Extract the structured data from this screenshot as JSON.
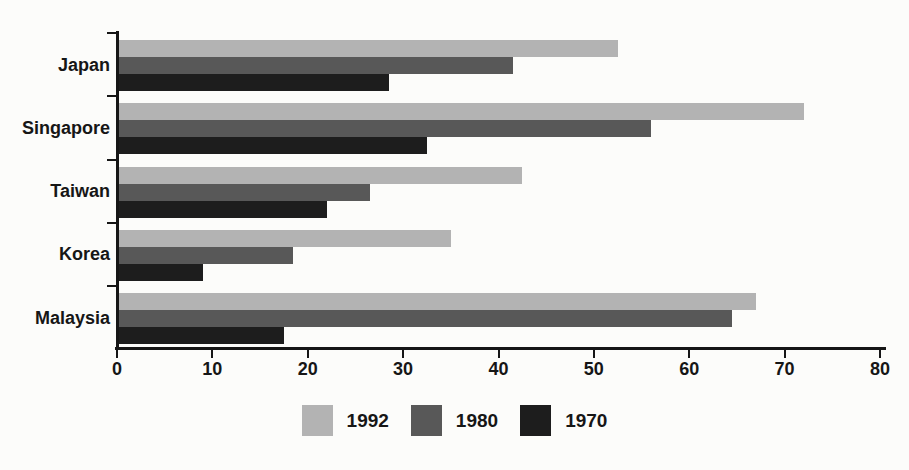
{
  "chart_data": {
    "type": "bar",
    "orientation": "horizontal",
    "title": "",
    "xlabel": "",
    "ylabel": "",
    "categories": [
      "Japan",
      "Singapore",
      "Taiwan",
      "Korea",
      "Malaysia"
    ],
    "series": [
      {
        "name": "1992",
        "color": "#b3b3b3",
        "values": [
          52.5,
          72,
          42.5,
          35,
          67
        ]
      },
      {
        "name": "1980",
        "color": "#585858",
        "values": [
          41.5,
          56,
          26.5,
          18.5,
          64.5
        ]
      },
      {
        "name": "1970",
        "color": "#1d1d1d",
        "values": [
          28.5,
          32.5,
          22,
          9,
          17.5
        ]
      }
    ],
    "xlim": [
      0,
      80
    ],
    "x_ticks": [
      0,
      10,
      20,
      30,
      40,
      50,
      60,
      70,
      80
    ],
    "grid": false,
    "legend_position": "bottom-center",
    "legend": [
      "1992",
      "1980",
      "1970"
    ]
  },
  "colors": {
    "axis": "#161616",
    "text": "#161616",
    "background": "#fcfcfa"
  }
}
